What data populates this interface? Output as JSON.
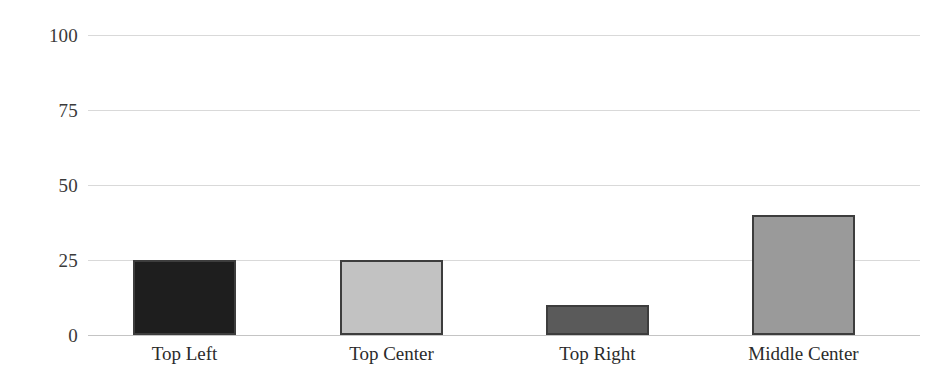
{
  "chart_data": {
    "type": "bar",
    "title": "",
    "subtitle": "",
    "xlabel": "",
    "ylabel": "",
    "categories": [
      "Top Left",
      "Top Center",
      "Top Right",
      "Middle Center"
    ],
    "values": [
      25,
      25,
      10,
      40
    ],
    "data_labels": [
      "25%",
      "25%",
      "10%",
      "40%"
    ],
    "ylim": [
      0,
      100
    ],
    "yticks": [
      "0",
      "25",
      "50",
      "75",
      "100"
    ],
    "ytick_values": [
      0,
      25,
      50,
      75,
      100
    ],
    "grid": true,
    "legend": "none",
    "bar_colors": [
      "#1e1e1e",
      "#c2c2c2",
      "#5a5a5a",
      "#9a9a9a"
    ],
    "bar_border_color": "#3d3d3d",
    "gridline_color": "#d9d9d9",
    "axis_color": "#c4c4c4",
    "background_color": "#ffffff",
    "bars": [
      {
        "label": "Top Left",
        "value": 25,
        "data_label": "25%",
        "color": "#1e1e1e"
      },
      {
        "label": "Top Center",
        "value": 25,
        "data_label": "25%",
        "color": "#c2c2c2"
      },
      {
        "label": "Top Right",
        "value": 10,
        "data_label": "10%",
        "color": "#5a5a5a"
      },
      {
        "label": "Middle Center",
        "value": 40,
        "data_label": "40%",
        "color": "#9a9a9a"
      }
    ]
  }
}
